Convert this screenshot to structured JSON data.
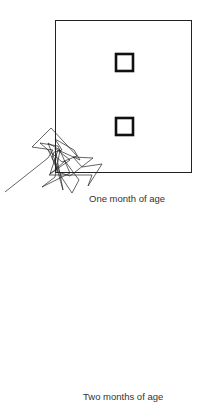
{
  "panels": [
    {
      "caption": "One month of age",
      "arena": {
        "x": 55,
        "y": 20,
        "w": 136,
        "h": 152
      },
      "targets": [
        {
          "x": 115,
          "y": 53,
          "w": 19,
          "h": 18
        },
        {
          "x": 115,
          "y": 117,
          "w": 19,
          "h": 18
        }
      ]
    },
    {
      "caption": "Two months of age",
      "arena": {
        "x": 56,
        "y": 235,
        "w": 136,
        "h": 151
      },
      "targets": [
        {
          "x": 115,
          "y": 268,
          "w": 19,
          "h": 19
        },
        {
          "x": 115,
          "y": 331,
          "w": 19,
          "h": 19
        }
      ]
    }
  ]
}
